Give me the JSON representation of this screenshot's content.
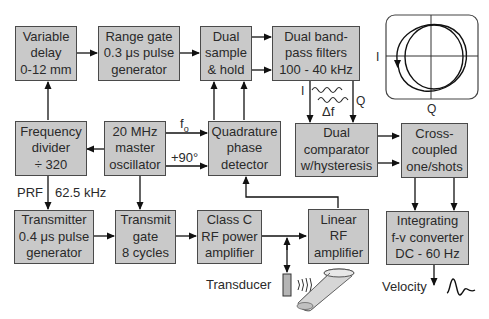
{
  "diagram": {
    "blocks": {
      "variable_delay": [
        "Variable",
        "delay",
        "0-12 mm"
      ],
      "range_gate": [
        "Range gate",
        "0.3 μs pulse",
        "generator"
      ],
      "dual_sample_hold": [
        "Dual",
        "sample",
        "& hold"
      ],
      "dual_bandpass": [
        "Dual band-",
        "pass filters",
        "100 - 40 kHz"
      ],
      "frequency_divider": [
        "Frequency",
        "divider",
        "÷ 320"
      ],
      "master_oscillator": [
        "20 MHz",
        "master",
        "oscillator"
      ],
      "quadrature_detector": [
        "Quadrature",
        "phase",
        "detector"
      ],
      "dual_comparator": [
        "Dual",
        "comparator",
        "w/hysteresis"
      ],
      "one_shots": [
        "Cross-",
        "coupled",
        "one/shots"
      ],
      "transmitter": [
        "Transmitter",
        "0.4 μs pulse",
        "generator"
      ],
      "transmit_gate": [
        "Transmit",
        "gate",
        "8 cycles"
      ],
      "class_c_amp": [
        "Class C",
        "RF power",
        "amplifier"
      ],
      "linear_rf_amp": [
        "Linear",
        "RF",
        "amplifier"
      ],
      "fv_converter": [
        "Integrating",
        "f-v converter",
        "DC - 60 Hz"
      ]
    },
    "labels": {
      "f0": "f",
      "f0_sub": "o",
      "plus90": "+90°",
      "prf": "PRF",
      "prf_value": "62.5 kHz",
      "i_signal": "I",
      "q_signal": "Q",
      "delta_f": "Δf",
      "scope_i": "I",
      "scope_q": "Q",
      "transducer": "Transducer",
      "velocity": "Velocity"
    }
  }
}
